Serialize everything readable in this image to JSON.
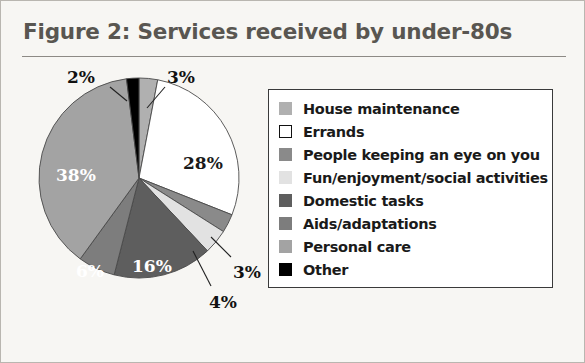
{
  "figure": {
    "title": "Figure 2: Services received by under-80s",
    "title_color": "#595651",
    "background_color": "#f7f6f3"
  },
  "chart_data": {
    "type": "pie",
    "title": "Figure 2: Services received by under-80s",
    "xlabel": "",
    "ylabel": "",
    "legend_position": "right",
    "grid": false,
    "start_angle_deg": 0,
    "direction": "clockwise",
    "categories": [
      "House maintenance",
      "Errands",
      "People keeping an eye on you",
      "Fun/enjoyment/social activities",
      "Domestic tasks",
      "Aids/adaptations",
      "Personal care",
      "Other"
    ],
    "values": [
      3,
      28,
      3,
      4,
      16,
      6,
      38,
      2
    ],
    "value_labels": [
      "3%",
      "28%",
      "3%",
      "4%",
      "16%",
      "6%",
      "38%",
      "2%"
    ],
    "colors": [
      "#b0b0b0",
      "#ffffff",
      "#8a8a8a",
      "#e2e2e2",
      "#5e5e5e",
      "#7d7d7d",
      "#a3a3a3",
      "#000000"
    ],
    "slice_border_color": "#4a4a4a"
  },
  "legend": {
    "items": [
      {
        "label": "House maintenance",
        "color": "#b0b0b0"
      },
      {
        "label": "Errands",
        "color": "#ffffff"
      },
      {
        "label": "People keeping an eye on you",
        "color": "#8a8a8a"
      },
      {
        "label": "Fun/enjoyment/social activities",
        "color": "#e2e2e2"
      },
      {
        "label": "Domestic tasks",
        "color": "#5e5e5e"
      },
      {
        "label": "Aids/adaptations",
        "color": "#7d7d7d"
      },
      {
        "label": "Personal care",
        "color": "#a3a3a3"
      },
      {
        "label": "Other",
        "color": "#000000"
      }
    ]
  },
  "pie_labels": [
    {
      "text": "2%",
      "x": 52,
      "y": 6,
      "style": "outside"
    },
    {
      "text": "3%",
      "x": 152,
      "y": 6,
      "style": "outside"
    },
    {
      "text": "28%",
      "x": 168,
      "y": 92,
      "style": "inside-dark"
    },
    {
      "text": "38%",
      "x": 41,
      "y": 104,
      "style": "inside"
    },
    {
      "text": "6%",
      "x": 61,
      "y": 200,
      "style": "inside"
    },
    {
      "text": "16%",
      "x": 117,
      "y": 195,
      "style": "inside"
    },
    {
      "text": "3%",
      "x": 218,
      "y": 201,
      "style": "outside"
    },
    {
      "text": "4%",
      "x": 194,
      "y": 231,
      "style": "outside"
    }
  ]
}
